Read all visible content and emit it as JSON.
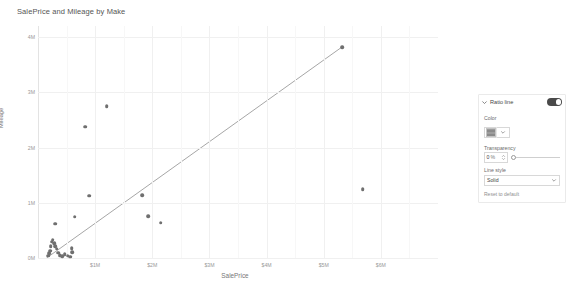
{
  "chart_data": {
    "type": "scatter",
    "title": "SalePrice and Mileage by Make",
    "xlabel": "SalePrice",
    "ylabel": "Mileage",
    "xlim": [
      0,
      7000000
    ],
    "ylim": [
      0,
      4200000
    ],
    "grid": true,
    "legend": null,
    "x_ticks": [
      {
        "value": 1000000,
        "label": "$1M"
      },
      {
        "value": 2000000,
        "label": "$2M"
      },
      {
        "value": 3000000,
        "label": "$3M"
      },
      {
        "value": 4000000,
        "label": "$4M"
      },
      {
        "value": 5000000,
        "label": "$5M"
      },
      {
        "value": 6000000,
        "label": "$6M"
      }
    ],
    "y_ticks": [
      {
        "value": 0,
        "label": "0M"
      },
      {
        "value": 1000000,
        "label": "1M"
      },
      {
        "value": 2000000,
        "label": "2M"
      },
      {
        "value": 3000000,
        "label": "3M"
      },
      {
        "value": 4000000,
        "label": "4M"
      }
    ],
    "point_color": "#6f6f6f",
    "trendline": {
      "name": "Ratio line",
      "color": "#808080",
      "style": "Solid",
      "x0": 150000,
      "y0": 0,
      "x1": 5320000,
      "y1": 3820000
    },
    "points": [
      {
        "x": 180000,
        "y": 40000
      },
      {
        "x": 200000,
        "y": 90000
      },
      {
        "x": 215000,
        "y": 130000
      },
      {
        "x": 225000,
        "y": 215000
      },
      {
        "x": 240000,
        "y": 295000
      },
      {
        "x": 255000,
        "y": 330000
      },
      {
        "x": 285000,
        "y": 265000
      },
      {
        "x": 300000,
        "y": 215000
      },
      {
        "x": 330000,
        "y": 170000
      },
      {
        "x": 350000,
        "y": 95000
      },
      {
        "x": 380000,
        "y": 55000
      },
      {
        "x": 420000,
        "y": 30000
      },
      {
        "x": 470000,
        "y": 70000
      },
      {
        "x": 520000,
        "y": 45000
      },
      {
        "x": 560000,
        "y": 25000
      },
      {
        "x": 600000,
        "y": 105000
      },
      {
        "x": 300000,
        "y": 620000
      },
      {
        "x": 640000,
        "y": 750000
      },
      {
        "x": 590000,
        "y": 180000
      },
      {
        "x": 900000,
        "y": 1130000
      },
      {
        "x": 830000,
        "y": 2380000
      },
      {
        "x": 1200000,
        "y": 2750000
      },
      {
        "x": 1820000,
        "y": 1140000
      },
      {
        "x": 1930000,
        "y": 760000
      },
      {
        "x": 2150000,
        "y": 640000
      },
      {
        "x": 5320000,
        "y": 3820000
      },
      {
        "x": 5680000,
        "y": 1250000
      }
    ]
  },
  "format_pane": {
    "section_title": "Ratio line",
    "section_expanded": true,
    "toggle_state": "On",
    "color": {
      "label": "Color",
      "swatch_color": "#8a8a8a",
      "chevron_icon": "chevron-down-icon"
    },
    "transparency": {
      "label": "Transparency",
      "value": "0",
      "unit": "%",
      "slider_position": 0
    },
    "line_style": {
      "label": "Line style",
      "value": "Solid",
      "options": [
        "Solid",
        "Dashed",
        "Dotted"
      ]
    },
    "reset_label": "Reset to default"
  }
}
